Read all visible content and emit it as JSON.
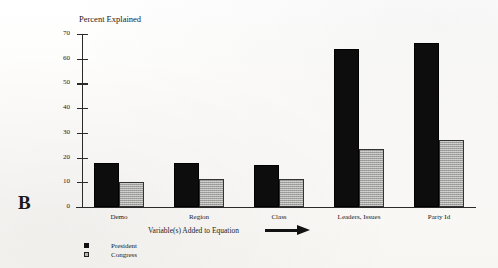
{
  "panel": {
    "letter": "B"
  },
  "legend": {
    "items": [
      {
        "label": "President",
        "swatch": "black-square-icon",
        "color": "#111111"
      },
      {
        "label": "Congress",
        "swatch": "gray-square-icon",
        "color": "#b9b9b4"
      }
    ]
  },
  "axis": {
    "y_title": "Percent Explained",
    "x_title": "Variable(s) Added to Equation",
    "x_arrow": "right-arrow-icon",
    "y_ticks": [
      70,
      60,
      50,
      40,
      30,
      20,
      10,
      0
    ]
  },
  "chart_data": {
    "type": "bar",
    "title": "Percent Explained",
    "xlabel": "Variable(s) Added to Equation",
    "ylabel": "Percent Explained",
    "ylim": [
      0,
      70
    ],
    "yticks": [
      0,
      10,
      20,
      30,
      40,
      50,
      60,
      70
    ],
    "grid": false,
    "legend_position": "below-left",
    "categories": [
      "Demo",
      "Region",
      "Class",
      "Leaders, Issues",
      "Party Id"
    ],
    "series": [
      {
        "name": "President",
        "color": "#0d0d0d",
        "values": [
          18,
          18,
          17,
          64,
          66.5
        ]
      },
      {
        "name": "Congress",
        "color": "#a5a5a0",
        "values": [
          10,
          11.5,
          11.5,
          23.5,
          27
        ]
      }
    ]
  }
}
